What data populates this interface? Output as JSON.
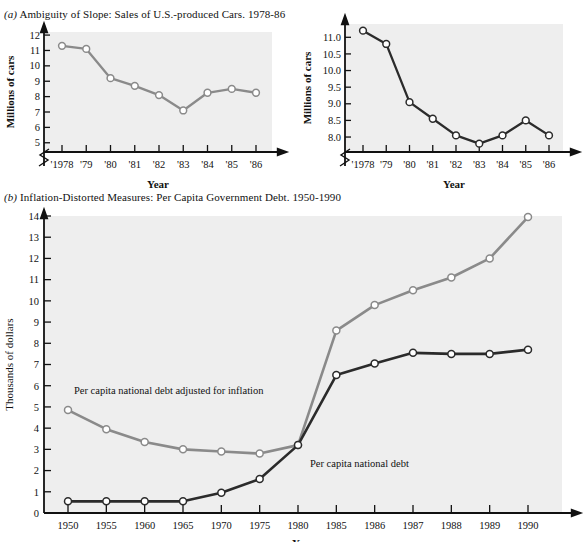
{
  "figure": {
    "panel_a_caption_label": "(a)",
    "panel_a_caption_text": "Ambiguity of Slope: Sales of U.S.-produced Cars. 1978-86",
    "panel_b_caption_label": "(b)",
    "panel_b_caption_text": "Inflation-Distorted Measures: Per Capita Government Debt. 1950-1990",
    "ink_light": "#8a8a8a",
    "ink_dark": "#2b2b2b",
    "plot_bg": "#eeeeee",
    "axis_color": "#111111",
    "marker_fill": "#ffffff"
  },
  "chart_data": [
    {
      "id": "cars-compressed",
      "type": "line",
      "title": "",
      "xlabel": "Year",
      "ylabel": "Millions of cars",
      "categories": [
        "'1978",
        "'79",
        "'80",
        "'81",
        "'82",
        "'83",
        "'84",
        "'85",
        "'86"
      ],
      "values": [
        11.3,
        11.1,
        9.2,
        8.7,
        8.1,
        7.1,
        8.25,
        8.5,
        8.25
      ],
      "ytick_labels": [
        "5",
        "6",
        "7",
        "8",
        "9",
        "10",
        "11",
        "12"
      ],
      "ytick_values": [
        5,
        6,
        7,
        8,
        9,
        10,
        11,
        12
      ],
      "ylim": [
        4.4,
        12.2
      ],
      "axis_break": true,
      "grid": false,
      "legend": "none",
      "series_color": "#8a8a8a"
    },
    {
      "id": "cars-expanded",
      "type": "line",
      "title": "",
      "xlabel": "Year",
      "ylabel": "Millions of cars",
      "categories": [
        "'1978",
        "'79",
        "'80",
        "'81",
        "'82",
        "'83",
        "'84",
        "'85",
        "'86"
      ],
      "values": [
        11.2,
        10.8,
        9.05,
        8.55,
        8.05,
        7.8,
        8.05,
        8.5,
        8.05
      ],
      "ytick_labels": [
        "8.0",
        "8.5",
        "9.0",
        "9.5",
        "10.0",
        "10.5",
        "11.0"
      ],
      "ytick_values": [
        8.0,
        8.5,
        9.0,
        9.5,
        10.0,
        10.5,
        11.0
      ],
      "ylim": [
        7.55,
        11.4
      ],
      "axis_break": true,
      "grid": false,
      "legend": "none",
      "series_color": "#2b2b2b"
    },
    {
      "id": "per-capita-debt",
      "type": "line",
      "title": "",
      "xlabel": "Year",
      "ylabel": "Thousands of dollars",
      "categories": [
        "1950",
        "1955",
        "1960",
        "1965",
        "1970",
        "1975",
        "1980",
        "1985",
        "1986",
        "1987",
        "1988",
        "1989",
        "1990"
      ],
      "ytick_labels": [
        "0",
        "1",
        "2",
        "3",
        "4",
        "5",
        "6",
        "7",
        "8",
        "9",
        "10",
        "11",
        "12",
        "13",
        "14"
      ],
      "ytick_values": [
        0,
        1,
        2,
        3,
        4,
        5,
        6,
        7,
        8,
        9,
        10,
        11,
        12,
        13,
        14
      ],
      "ylim": [
        0,
        14
      ],
      "grid": false,
      "legend": "inline-annotations",
      "series": [
        {
          "name": "Per capita national debt adjusted for inflation",
          "color": "#8a8a8a",
          "values": [
            4.85,
            3.95,
            3.35,
            3.0,
            2.9,
            2.8,
            3.2,
            8.6,
            9.8,
            10.5,
            11.1,
            12.0,
            13.95
          ],
          "annotation": "Per capita national debt adjusted for inflation",
          "annotation_x": 1950,
          "annotation_y": 5.6
        },
        {
          "name": "Per capita national debt",
          "color": "#2b2b2b",
          "values": [
            0.55,
            0.55,
            0.55,
            0.55,
            0.95,
            1.6,
            3.2,
            6.5,
            7.05,
            7.55,
            7.5,
            7.5,
            7.7
          ],
          "annotation": "Per capita national debt",
          "annotation_x": 1981,
          "annotation_y": 2.15
        }
      ]
    }
  ]
}
